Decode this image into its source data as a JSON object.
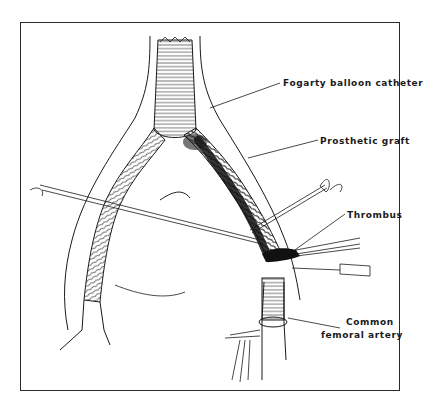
{
  "figure": {
    "colors": {
      "ink": "#1a1a1a",
      "background": "#ffffff",
      "frame": "#2a2a2a"
    },
    "labels": [
      {
        "id": "fogarty",
        "text": "Fogarty balloon catheter"
      },
      {
        "id": "graft",
        "text": "Prosthetic graft"
      },
      {
        "id": "thrombus",
        "text": "Thrombus"
      },
      {
        "id": "femoral_line1",
        "text": "Common"
      },
      {
        "id": "femoral_line2",
        "text": "femoral artery"
      }
    ]
  }
}
